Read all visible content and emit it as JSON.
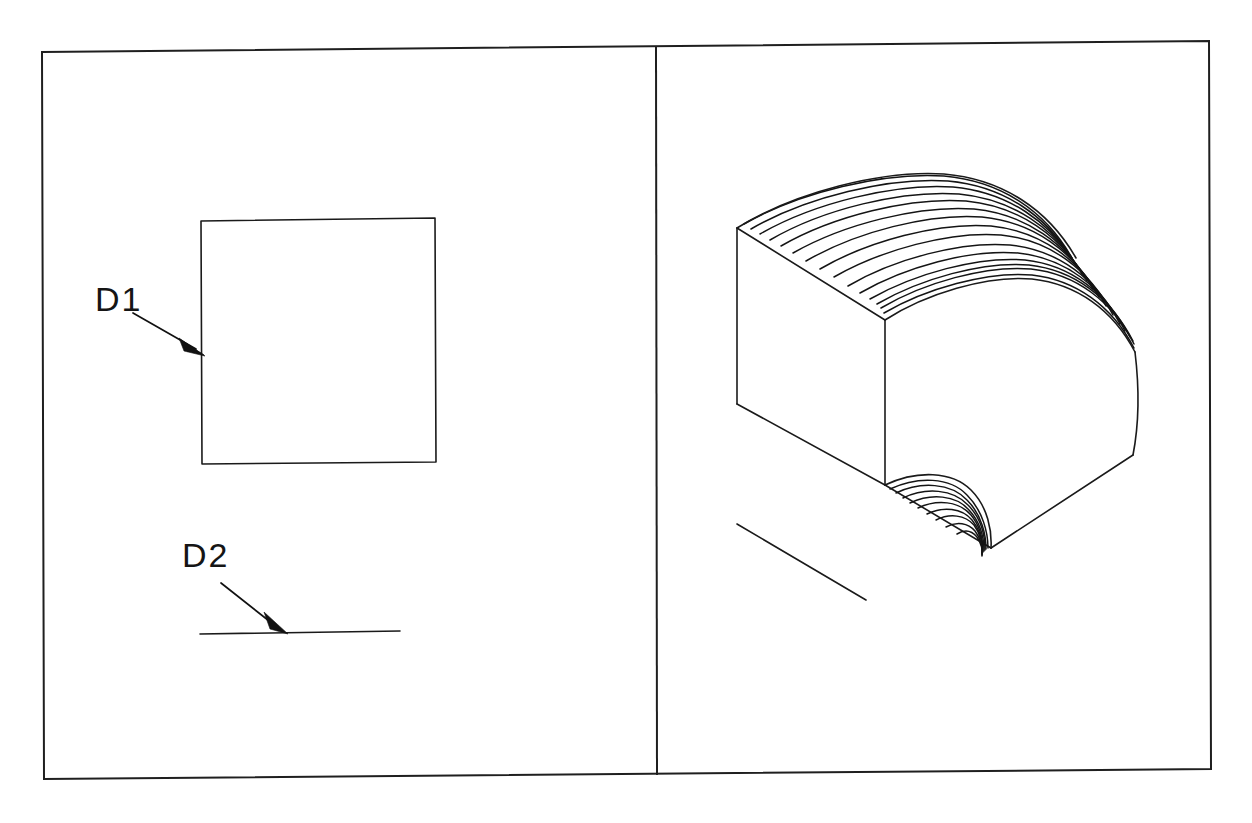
{
  "sheet": {
    "title": "Technical Drawing — Rounded Edge Solid",
    "background_color": "#ffffff",
    "line_color": "#1a1a1a",
    "width": 1252,
    "height": 823
  },
  "frame": {
    "name": "drawing-border",
    "left": 42,
    "top": 46,
    "right": 1210,
    "bottom": 776,
    "divider_x": 655
  },
  "left_panel": {
    "name": "orthographic-view",
    "square": {
      "label": "square-face-outline",
      "left": 201,
      "top": 220,
      "right": 435,
      "bottom": 463
    },
    "base_line": {
      "label": "horizontal-edge-line",
      "x1": 200,
      "y1": 634,
      "x2": 400,
      "y2": 632
    },
    "annotations": [
      {
        "id": "D1",
        "label": "D1",
        "text_x": 95,
        "text_y": 310,
        "leader_start_x": 133,
        "leader_start_y": 314,
        "leader_end_x": 204,
        "leader_end_y": 355
      },
      {
        "id": "D2",
        "label": "D2",
        "text_x": 182,
        "text_y": 566,
        "leader_start_x": 221,
        "leader_start_y": 583,
        "leader_end_x": 287,
        "leader_end_y": 634
      }
    ]
  },
  "right_panel": {
    "name": "isometric-view",
    "solid": {
      "label": "rounded-edge-block",
      "vertices": {
        "top_back_left": [
          737,
          228
        ],
        "top_front_left": [
          885,
          320
        ],
        "bottom_front_left": [
          885,
          485
        ],
        "bottom_back_left": [
          737,
          404
        ],
        "bottom_front_right": [
          991,
          548
        ],
        "right_extreme": [
          1133,
          455
        ],
        "curve_apex_back": [
          985,
          178
        ]
      },
      "mesh_line_count_top": 18,
      "mesh_line_count_bottom": 9
    },
    "reference_line": {
      "label": "ground-reference-line",
      "x1": 737,
      "y1": 524,
      "x2": 866,
      "y2": 600
    }
  }
}
